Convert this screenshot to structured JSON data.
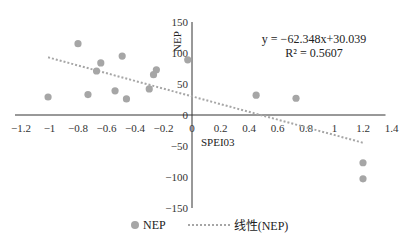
{
  "chart_data": {
    "type": "scatter",
    "title": "",
    "xlabel": "SPEI03",
    "ylabel": "NEP",
    "xlim": [
      -1.2,
      1.4
    ],
    "ylim": [
      -150,
      150
    ],
    "x_ticks": [
      "-1.2",
      "-1",
      "-0.8",
      "-0.6",
      "-0.4",
      "-0.2",
      "0",
      "0.2",
      "0.4",
      "0.6",
      "0.8",
      "1",
      "1.2",
      "1.4"
    ],
    "y_ticks": [
      "150",
      "100",
      "50",
      "0",
      "-50",
      "-100",
      "-150"
    ],
    "grid": false,
    "legend_position": "bottom",
    "series": [
      {
        "name": "NEP",
        "kind": "scatter",
        "color": "#a6a6a6",
        "points": [
          {
            "x": -1.01,
            "y": 29
          },
          {
            "x": -0.8,
            "y": 115
          },
          {
            "x": -0.73,
            "y": 33
          },
          {
            "x": -0.67,
            "y": 71
          },
          {
            "x": -0.64,
            "y": 84
          },
          {
            "x": -0.54,
            "y": 39
          },
          {
            "x": -0.49,
            "y": 95
          },
          {
            "x": -0.46,
            "y": 26
          },
          {
            "x": -0.3,
            "y": 42
          },
          {
            "x": -0.27,
            "y": 65
          },
          {
            "x": -0.25,
            "y": 73
          },
          {
            "x": -0.03,
            "y": 89
          },
          {
            "x": 0.45,
            "y": 32
          },
          {
            "x": 0.73,
            "y": 27
          },
          {
            "x": 1.2,
            "y": -77
          },
          {
            "x": 1.2,
            "y": -103
          }
        ]
      },
      {
        "name": "线性(NEP)",
        "kind": "linear-trendline",
        "color": "#a6a6a6",
        "slope": -62.348,
        "intercept": 30.039,
        "x_range": [
          -1.01,
          1.2
        ]
      }
    ],
    "annotations": {
      "equation": "y = −62.348x+30.039",
      "r_squared": "R² = 0.5607"
    }
  },
  "legend": {
    "items": [
      {
        "label": "NEP",
        "marker": "dot"
      },
      {
        "label": "线性(NEP)",
        "marker": "dotted-line"
      }
    ]
  }
}
